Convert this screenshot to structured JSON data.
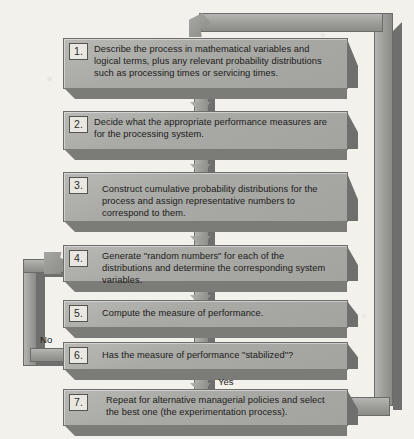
{
  "diagram": {
    "background_color": "#f3f1ec",
    "box_fill_color": "#a9a9a6",
    "box_shadow_color": "#6f6f6d",
    "steps": [
      {
        "number": "1.",
        "text": "Describe the process in mathematical variables and logical terms, plus any relevant probability distributions such as processing times or servicing times."
      },
      {
        "number": "2.",
        "text": "Decide what the appropriate performance measures are for the processing system."
      },
      {
        "number": "3.",
        "text": "Construct cumulative probability distributions for the process and assign representative numbers to correspond to them."
      },
      {
        "number": "4.",
        "text": "Generate \"random numbers\" for each of the distributions and determine the corresponding system variables."
      },
      {
        "number": "5.",
        "text": "Compute the measure of performance."
      },
      {
        "number": "6.",
        "text": "Has the measure of performance \"stabilized\"?"
      },
      {
        "number": "7.",
        "text": "Repeat for alternative managerial policies and select the best one (the experimentation process)."
      }
    ],
    "edge_labels": {
      "no": "No",
      "yes": "Yes"
    },
    "connectors": [
      {
        "name": "step1-to-step2",
        "kind": "down-arrow"
      },
      {
        "name": "step2-to-step3",
        "kind": "down-arrow"
      },
      {
        "name": "step3-to-step4",
        "kind": "down-arrow"
      },
      {
        "name": "step4-to-step5",
        "kind": "down-arrow"
      },
      {
        "name": "step5-to-step6",
        "kind": "down-arrow"
      },
      {
        "name": "step6-to-step7",
        "kind": "down-arrow"
      },
      {
        "name": "step6-no-loop-back-to-step4",
        "kind": "left-loop"
      },
      {
        "name": "step7-loop-back-to-step1",
        "kind": "right-loop"
      }
    ]
  }
}
